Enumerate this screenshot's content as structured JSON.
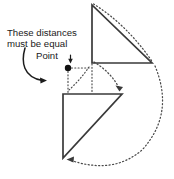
{
  "figure": {
    "type": "geometry-diagram",
    "background_color": "#ffffff",
    "width": 174,
    "height": 179
  },
  "annotations": {
    "distance_note_line1": "These distances",
    "distance_note_line2": "must be equal",
    "point_label": "Point"
  },
  "colors": {
    "solid_line": "#3a3a3a",
    "dotted_line": "#4a4a4a",
    "arrow": "#1c1c1c",
    "point_dot": "#111111",
    "text": "#1a1a1a"
  },
  "shapes": {
    "upper_triangle": {
      "name": "upper-right-triangle",
      "vertices": "92,5 92,63 152,63",
      "right_angle_at": "92,63"
    },
    "lower_triangle": {
      "name": "lower-right-triangle",
      "vertices": "63,94 122,94 63,158",
      "right_angle_at": "63,94"
    }
  },
  "paths": {
    "arc_top_hypotenuse": "M 93.5 4 Q 126 24 151 60",
    "arc_apex_to_lower_right": "M 96 60 Q 113 76 120 90",
    "arc_large_right": "M 154 66 Q 174 116 140 152 Q 112 174 68 160",
    "arc_small_near_point": "M 70 86 Q 80 78 88 66",
    "dotted_horizontal_from_point": "M 70 68 L 91 68",
    "dotted_vertical_from_point": "M 68 70 L 68 93",
    "dotted_vertical_through_upper": "M 92 66 L 92 92",
    "arrow_curve_from_text": "M 25 49 C 22 62 24 76 44 80",
    "point_leader": "M 70 56 L 70 63"
  },
  "markers": {
    "point_dot_center": "68,68",
    "point_dot_radius": 3.1,
    "arrowhead_text_to_line": "44,80",
    "arrowhead_lower_right": "120,90",
    "arrowhead_bottom_left": "68,160"
  }
}
